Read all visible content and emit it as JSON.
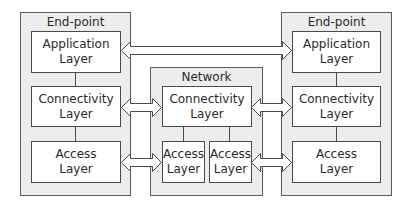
{
  "diagram": {
    "left_endpoint": {
      "title": "End-point",
      "layers": [
        {
          "line1": "Application",
          "line2": "Layer"
        },
        {
          "line1": "Connectivity",
          "line2": "Layer"
        },
        {
          "line1": "Access",
          "line2": "Layer"
        }
      ]
    },
    "network": {
      "title": "Network",
      "connectivity": {
        "line1": "Connectivity",
        "line2": "Layer"
      },
      "access_left": {
        "line1": "Access",
        "line2": "Layer"
      },
      "access_right": {
        "line1": "Access",
        "line2": "Layer"
      }
    },
    "right_endpoint": {
      "title": "End-point",
      "layers": [
        {
          "line1": "Application",
          "line2": "Layer"
        },
        {
          "line1": "Connectivity",
          "line2": "Layer"
        },
        {
          "line1": "Access",
          "line2": "Layer"
        }
      ]
    },
    "arrows": [
      {
        "from": "left-application",
        "to": "right-application",
        "type": "bidirectional"
      },
      {
        "from": "left-connectivity",
        "to": "network-connectivity",
        "type": "bidirectional"
      },
      {
        "from": "network-connectivity",
        "to": "right-connectivity",
        "type": "bidirectional"
      },
      {
        "from": "left-access",
        "to": "network-access-left",
        "type": "bidirectional"
      },
      {
        "from": "network-access-right",
        "to": "right-access",
        "type": "bidirectional"
      }
    ],
    "colors": {
      "container_fill": "#ededed",
      "layer_fill": "#ffffff",
      "border": "#4a4a4a"
    }
  }
}
